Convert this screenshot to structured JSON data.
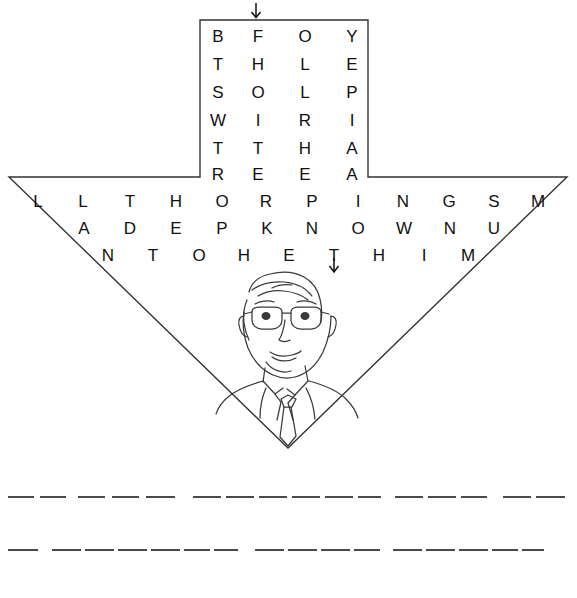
{
  "puzzle": {
    "title": "Funnel Letter Puzzle",
    "shape": "funnel",
    "top_arrow": "down-arrow-start",
    "inner_arrow": "down-arrow-continue",
    "neck": {
      "columns": 4,
      "rows": 6,
      "grid": [
        [
          "B",
          "F",
          "O",
          "Y"
        ],
        [
          "T",
          "H",
          "L",
          "E"
        ],
        [
          "S",
          "O",
          "L",
          "P"
        ],
        [
          "W",
          "I",
          "R",
          "I"
        ],
        [
          "T",
          "T",
          "H",
          "A"
        ],
        [
          "R",
          "E",
          "E",
          "A"
        ]
      ]
    },
    "wide_rows": [
      {
        "id": "row-wide-1",
        "letters": [
          "L",
          "L",
          "T",
          "H",
          "O",
          "R",
          "P",
          "I",
          "N",
          "G",
          "S",
          "M"
        ]
      },
      {
        "id": "row-wide-2",
        "letters": [
          "A",
          "D",
          "E",
          "P",
          "K",
          "N",
          "O",
          "W",
          "N",
          "U"
        ]
      },
      {
        "id": "row-wide-3",
        "letters": [
          "N",
          "T",
          "O",
          "H",
          "E",
          "T",
          "H",
          "I",
          "M"
        ]
      }
    ],
    "portrait": {
      "alt_label": "line drawing of a man wearing glasses, suit and tie"
    },
    "answer_lines": [
      {
        "id": "answer-line-1",
        "groups": [
          {
            "count": 2,
            "x": 8,
            "width": 58
          },
          {
            "count": 3,
            "x": 78,
            "width": 97
          },
          {
            "count": 6,
            "x": 193,
            "width": 188
          },
          {
            "count": 3,
            "x": 395,
            "width": 92
          },
          {
            "count": 2,
            "x": 503,
            "width": 62
          }
        ]
      },
      {
        "id": "answer-line-2",
        "groups": [
          {
            "count": 1,
            "x": 8,
            "width": 30
          },
          {
            "count": 6,
            "x": 52,
            "width": 186
          },
          {
            "count": 4,
            "x": 255,
            "width": 125
          },
          {
            "count": 5,
            "x": 393,
            "width": 151
          }
        ]
      }
    ],
    "colors": {
      "ink": "#111111",
      "outline": "#333333",
      "blank_line": "#4a4a4a",
      "background": "#ffffff"
    }
  }
}
